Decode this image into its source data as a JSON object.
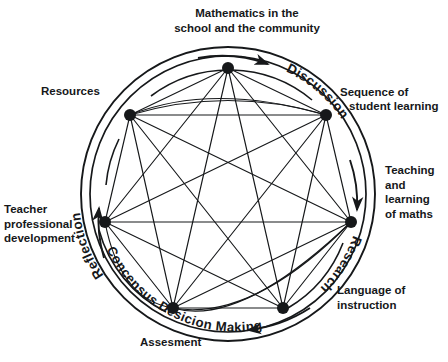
{
  "figure": {
    "type": "network-wheel-diagram",
    "title": "Mathematics in the school and the community",
    "background_color": "#ffffff",
    "ink_color": "#16181a"
  },
  "outer_labels": {
    "top": "Mathematics in the\nschool and the community",
    "upper_left": "Resources",
    "upper_right_line1": "Sequence of",
    "upper_right_line2": "student learning",
    "right": "Teaching\nand\nlearning\nof maths",
    "left": "Teacher\nprofessional\ndevelopment",
    "lower_right": "Language of\ninstruction",
    "bottom": "Assesment"
  },
  "ring_labels": [
    {
      "name": "reflection",
      "text": "Reflection"
    },
    {
      "name": "discussion",
      "text": "Discussion"
    },
    {
      "name": "research",
      "text": "Research"
    },
    {
      "name": "consensus-decision-making",
      "text": "Concensus Desicion Making"
    }
  ],
  "arrows": [
    {
      "name": "arrow-reflection-upward",
      "direction": "counterclockwise-up"
    },
    {
      "name": "arrow-discussion-clockwise",
      "direction": "clockwise-right"
    },
    {
      "name": "arrow-research-downward",
      "direction": "clockwise-down"
    },
    {
      "name": "arrow-consensus-leftward",
      "direction": "clockwise-left"
    }
  ],
  "chart_data": {
    "type": "scatter",
    "title": "Mathematics in the school and the community",
    "center": {
      "x": 228,
      "y": 194
    },
    "node_radius_px": 126,
    "node_dot_size_px": 6,
    "nodes": [
      {
        "id": 0,
        "label_angle_deg": -90,
        "x": 228,
        "y": 68
      },
      {
        "id": 1,
        "label_angle_deg": -38.6,
        "x": 326,
        "y": 115
      },
      {
        "id": 2,
        "label_angle_deg": 12.9,
        "x": 351,
        "y": 222
      },
      {
        "id": 3,
        "label_angle_deg": 64.3,
        "x": 283,
        "y": 308
      },
      {
        "id": 4,
        "label_angle_deg": 115.7,
        "x": 173,
        "y": 308
      },
      {
        "id": 5,
        "label_angle_deg": 167.1,
        "x": 105,
        "y": 222
      },
      {
        "id": 6,
        "label_angle_deg": 218.6,
        "x": 130,
        "y": 115
      }
    ],
    "edges": "complete-graph-k7",
    "edge_count": 21,
    "rings": [
      {
        "name": "outer-ring",
        "radius_px": 147
      },
      {
        "name": "middle-ring",
        "radius_px": 138
      },
      {
        "name": "inner-arc-ring",
        "radius_px": 130
      }
    ],
    "grid": false,
    "legend": "none"
  }
}
